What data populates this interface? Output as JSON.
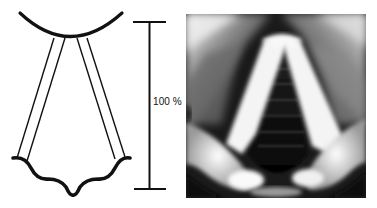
{
  "figure": {
    "schematic": {
      "label": "vocal-fold-schematic",
      "stroke_color": "#111111"
    },
    "scale_bar": {
      "label": "100 %",
      "color": "#111111"
    },
    "photo": {
      "label": "laryngoscopic-image",
      "palette": {
        "dark": "#0a0a0a",
        "mid": "#7a7a7a",
        "light": "#f2f2f2"
      }
    }
  }
}
